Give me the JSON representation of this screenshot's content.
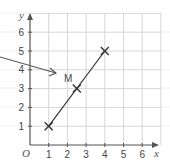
{
  "diagram": {
    "type": "coordinate-grid",
    "origin_label": "O",
    "x_axis": {
      "label": "x",
      "ticks": [
        "1",
        "2",
        "3",
        "4",
        "5",
        "6"
      ]
    },
    "y_axis": {
      "label": "y",
      "ticks": [
        "1",
        "2",
        "3",
        "4",
        "5",
        "6"
      ]
    },
    "points": [
      {
        "name": "A",
        "x": 1,
        "y": 1,
        "marker": "cross"
      },
      {
        "name": "M",
        "x": 2.5,
        "y": 3,
        "marker": "cross",
        "label": "M"
      },
      {
        "name": "B",
        "x": 4,
        "y": 5,
        "marker": "cross"
      }
    ],
    "segment": {
      "from": [
        1,
        1
      ],
      "to": [
        4,
        5
      ]
    },
    "pointer_arrow": {
      "target": "M"
    },
    "colors": {
      "grid": "#d9d9d9",
      "axis": "#555555",
      "line": "#333333"
    }
  }
}
